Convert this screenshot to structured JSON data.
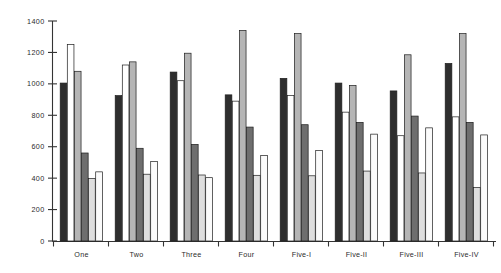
{
  "chart_data": {
    "type": "bar",
    "title": "",
    "subtitle": "",
    "xlabel": "",
    "ylabel": "",
    "ylim": [
      0,
      1400
    ],
    "yticks": [
      0,
      200,
      400,
      600,
      800,
      1000,
      1200,
      1400
    ],
    "ytick_labels": [
      "0",
      "200",
      "400",
      "600",
      "800",
      "1000",
      "1200",
      "1400"
    ],
    "grid": false,
    "legend_position": "none",
    "categories": [
      "One",
      "Two",
      "Three",
      "Four",
      "Five-I",
      "Five-II",
      "Five-III",
      "Five-IV"
    ],
    "series": [
      {
        "name": "Series 1",
        "fill": "#2e2e2e",
        "values": [
          1005,
          925,
          1075,
          930,
          1035,
          1005,
          955,
          1130
        ]
      },
      {
        "name": "Series 2",
        "fill": "#ffffff",
        "values": [
          1250,
          1120,
          1020,
          890,
          925,
          820,
          670,
          790
        ]
      },
      {
        "name": "Series 3",
        "fill": "#b5b5b5",
        "values": [
          1080,
          1140,
          1195,
          1340,
          1320,
          990,
          1185,
          1320
        ]
      },
      {
        "name": "Series 4",
        "fill": "#6e6e6e",
        "values": [
          560,
          590,
          615,
          725,
          740,
          755,
          795,
          755
        ]
      },
      {
        "name": "Series 5",
        "fill": "#dedede",
        "values": [
          398,
          425,
          420,
          418,
          415,
          445,
          433,
          340
        ]
      },
      {
        "name": "Series 6",
        "fill": "#fbfbfb",
        "values": [
          440,
          505,
          403,
          545,
          575,
          680,
          720,
          675
        ]
      }
    ]
  },
  "axis": {
    "y_axis_name": "value-axis",
    "x_axis_name": "category-axis"
  }
}
